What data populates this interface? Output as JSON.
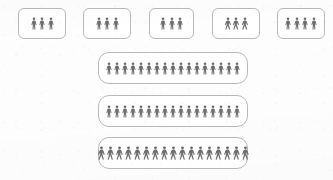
{
  "canvas": {
    "width": 333,
    "height": 180,
    "background_color": "#fdfdfd",
    "figure_color": "#6e6e6e",
    "box_border_color": "#b9b9b9",
    "box_fill_color": "#ffffff"
  },
  "icon_names": {
    "standing": "person-standing-icon",
    "walking": "person-walking-icon"
  },
  "chart_data": {
    "type": "pictogram",
    "title": "",
    "subtitle": "",
    "xlabel": "",
    "ylabel": "",
    "unit_value": 1,
    "unit_label": "person",
    "legend": [],
    "grid": false,
    "categories": [
      "Group 1",
      "Group 2",
      "Group 3",
      "Group 4",
      "Group 5",
      "Group 6",
      "Group 7",
      "Group 8"
    ],
    "values": [
      3,
      3,
      3,
      3,
      4,
      17,
      17,
      17
    ]
  },
  "groups": [
    {
      "name": "group-box-1",
      "row": "top",
      "count": 3,
      "pose": "standing",
      "x": 18,
      "y": 8,
      "width": 48,
      "height": 31,
      "icon_size": 13
    },
    {
      "name": "group-box-2",
      "row": "top",
      "count": 3,
      "pose": "standing",
      "x": 83,
      "y": 8,
      "width": 48,
      "height": 31,
      "icon_size": 13
    },
    {
      "name": "group-box-3",
      "row": "top",
      "count": 3,
      "pose": "standing",
      "x": 149,
      "y": 8,
      "width": 45,
      "height": 31,
      "icon_size": 13
    },
    {
      "name": "group-box-4",
      "row": "top",
      "count": 3,
      "pose": "walking",
      "x": 212,
      "y": 8,
      "width": 48,
      "height": 31,
      "icon_size": 13
    },
    {
      "name": "group-box-5",
      "row": "top",
      "count": 4,
      "pose": "standing",
      "x": 277,
      "y": 8,
      "width": 48,
      "height": 31,
      "icon_size": 13
    },
    {
      "name": "group-box-6",
      "row": "wide",
      "count": 17,
      "pose": "standing",
      "x": 98,
      "y": 52,
      "width": 150,
      "height": 32,
      "icon_size": 13
    },
    {
      "name": "group-box-7",
      "row": "wide",
      "count": 17,
      "pose": "standing",
      "x": 98,
      "y": 95,
      "width": 150,
      "height": 32,
      "icon_size": 13
    },
    {
      "name": "group-box-8",
      "row": "wide",
      "count": 17,
      "pose": "walking",
      "x": 98,
      "y": 137,
      "width": 150,
      "height": 32,
      "icon_size": 14
    }
  ]
}
